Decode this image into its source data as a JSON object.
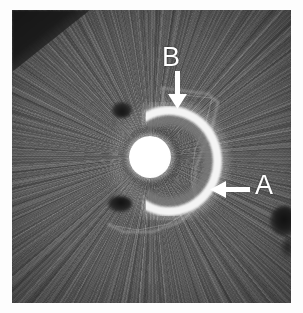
{
  "figure": {
    "domain": "medical-imaging",
    "modality_appearance": "grayscale cross-sectional CT slice with radial metal-streak artifact",
    "caption_visible": false,
    "plate": {
      "x": 12,
      "y": 10,
      "width": 279,
      "height": 293,
      "background_hex": "#585858",
      "border_hex": "#ffffff"
    }
  },
  "annotations": [
    {
      "id": "b",
      "letter": "B",
      "letter_color_hex": "#ffffff",
      "letter_x": 150,
      "letter_y": 34,
      "arrow": {
        "direction": "down",
        "color_hex": "#ffffff",
        "tail_x": 166,
        "tail_y": 63,
        "tip_x": 166,
        "tip_y": 98
      },
      "points_to": "bright crescent upper margin"
    },
    {
      "id": "a",
      "letter": "A",
      "letter_color_hex": "#ffffff",
      "letter_x": 243,
      "letter_y": 162,
      "arrow": {
        "direction": "left",
        "color_hex": "#ffffff",
        "tail_x": 236,
        "tail_y": 180,
        "tip_x": 200,
        "tip_y": 180
      },
      "points_to": "faint angular outline lateral to implant"
    }
  ],
  "features": [
    {
      "name": "central-core",
      "description": "bright round dense core",
      "center_x": 138,
      "center_y": 147,
      "diameter": 42,
      "intensity_hex": "#ffffff"
    },
    {
      "name": "crescent-ring",
      "description": "bright C-shaped ring open toward the left",
      "center_x": 157,
      "center_y": 151,
      "outer_diameter": 110,
      "intensity_hex": "#f4f4f4"
    },
    {
      "name": "faint-outline",
      "description": "thin faint angular boundary lateral and inferior to the implant",
      "intensity_hex": "#9a9a9a"
    },
    {
      "name": "dark-corner",
      "description": "dark triangular region in the upper-left corner",
      "intensity_hex": "#181818"
    },
    {
      "name": "dark-blob-right",
      "description": "small dark blob along the right margin",
      "intensity_hex": "#111111"
    }
  ],
  "colors": {
    "background_white": "#ffffff",
    "tissue_mid_gray": "#585858",
    "tissue_light_gray": "#6a6a6a",
    "tissue_dark_gray": "#3f3f3f",
    "marker_white": "#ffffff",
    "dense_core_white": "#ffffff"
  }
}
